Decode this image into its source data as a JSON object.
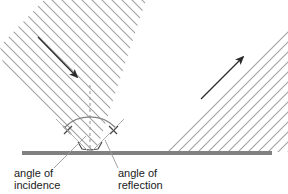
{
  "figure": {
    "background_color": "#ffffff"
  },
  "colors": {
    "hatch_line": "#a0a0a0",
    "beam_edge": "#b4b4b4",
    "surface": "#808080",
    "arrow": "#2b2b2b",
    "normal_line": "#9a9a9a",
    "arc": "#707070",
    "tick": "#4a4a4a",
    "leader": "#9a9a9a",
    "text": "#1a1a1a"
  },
  "surface": {
    "name": "reflecting surface",
    "x_start": 22,
    "x_end": 272,
    "y": 153,
    "thickness": 4
  },
  "normal": {
    "name": "normal",
    "x": 90,
    "y_top": 85,
    "y_bottom": 153,
    "style": "dashed"
  },
  "incident_beam": {
    "name": "incident beam",
    "arrow": {
      "x1": 38,
      "y1": 37,
      "x2": 79,
      "y2": 79
    },
    "hatch_angle_deg": 45,
    "direction": "down-right"
  },
  "reflected_beam": {
    "name": "reflected beam",
    "arrow": {
      "x1": 202,
      "y1": 98,
      "x2": 245,
      "y2": 55
    },
    "hatch_angle_deg": -45,
    "direction": "up-right"
  },
  "angles": {
    "incidence": {
      "label_line1": "angle of",
      "label_line2": "incidence",
      "label_x": 14,
      "label_y1": 176,
      "label_y2": 188,
      "leader": {
        "x1": 56,
        "y1": 168,
        "x2": 85,
        "y2": 140
      },
      "tick_mark": {
        "x1": 66,
        "y1": 127,
        "x2": 72,
        "y2": 134
      }
    },
    "reflection": {
      "label_line1": "angle of",
      "label_line2": "reflection",
      "label_x": 118,
      "label_y1": 176,
      "label_y2": 188,
      "leader": {
        "x1": 116,
        "y1": 168,
        "x2": 104,
        "y2": 141
      },
      "tick_mark": {
        "x1": 108,
        "y1": 127,
        "x2": 115,
        "y2": 133
      }
    },
    "arc": {
      "center_x": 90,
      "center_y": 153,
      "radius": 36,
      "start_deg": 135,
      "end_deg": 45
    }
  },
  "labels": [
    {
      "id": "angle-of-incidence",
      "line1": "angle of",
      "line2": "incidence"
    },
    {
      "id": "angle-of-reflection",
      "line1": "angle of",
      "line2": "reflection"
    }
  ]
}
